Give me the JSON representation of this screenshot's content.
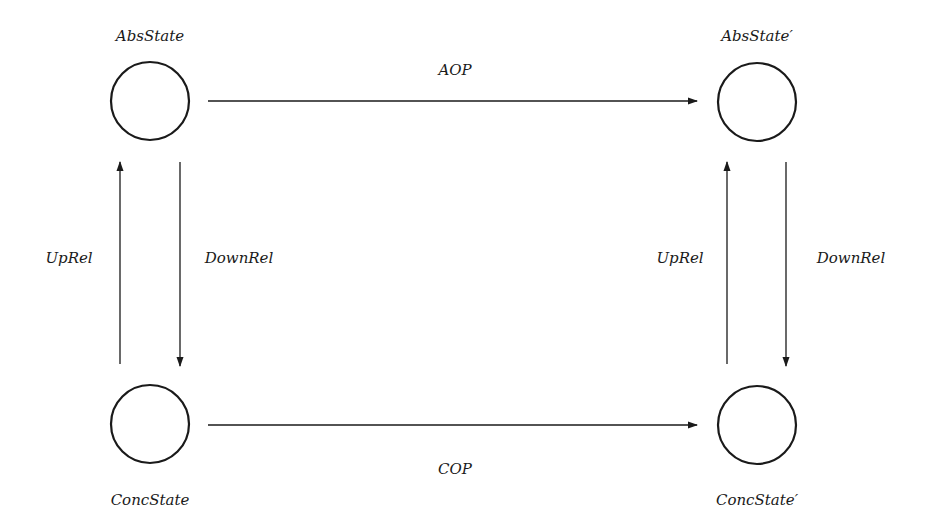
{
  "diagram": {
    "type": "commuting-diagram",
    "colors": {
      "stroke": "#1a1a1a",
      "background": "#ffffff",
      "text": "#1a1a1a"
    },
    "nodes": [
      {
        "id": "abs",
        "label": "AbsState",
        "cx": 150,
        "cy": 101,
        "r": 39,
        "label_x": 150,
        "label_y": 36
      },
      {
        "id": "abs2",
        "label": "AbsState′",
        "cx": 757,
        "cy": 102,
        "r": 39,
        "label_x": 757,
        "label_y": 36
      },
      {
        "id": "conc",
        "label": "ConcState",
        "cx": 150,
        "cy": 424,
        "r": 39,
        "label_x": 150,
        "label_y": 500
      },
      {
        "id": "conc2",
        "label": "ConcState′",
        "cx": 757,
        "cy": 425,
        "r": 39,
        "label_x": 757,
        "label_y": 500
      }
    ],
    "edges": [
      {
        "id": "aop",
        "label": "AOP",
        "from": "abs",
        "to": "abs2",
        "label_x": 455,
        "label_y": 70
      },
      {
        "id": "cop",
        "label": "COP",
        "from": "conc",
        "to": "conc2",
        "label_x": 455,
        "label_y": 469
      },
      {
        "id": "uprel-left",
        "label": "UpRel",
        "from": "conc",
        "to": "abs",
        "label_x": 69,
        "label_y": 258
      },
      {
        "id": "downrel-left",
        "label": "DownRel",
        "from": "abs",
        "to": "conc",
        "label_x": 239,
        "label_y": 258
      },
      {
        "id": "uprel-right",
        "label": "UpRel",
        "from": "conc2",
        "to": "abs2",
        "label_x": 680,
        "label_y": 258
      },
      {
        "id": "downrel-right",
        "label": "DownRel",
        "from": "abs2",
        "to": "conc2",
        "label_x": 851,
        "label_y": 258
      }
    ]
  }
}
